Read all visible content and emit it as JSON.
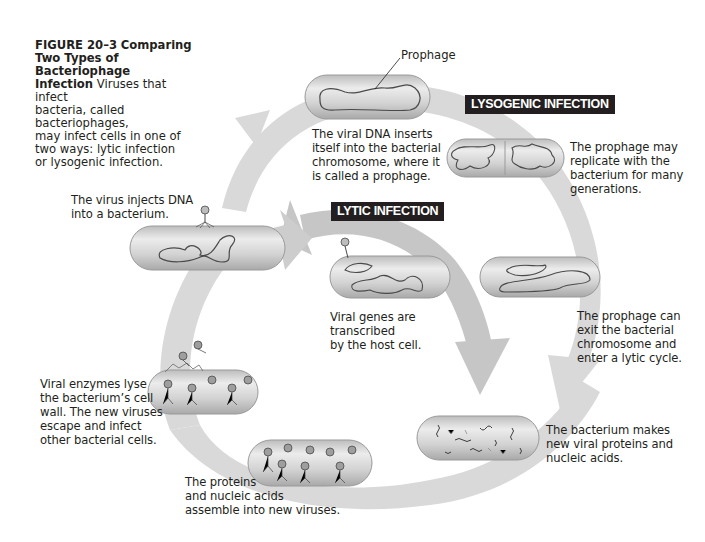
{
  "figure": {
    "number": "FIGURE 20–3",
    "title": "Comparing Two Types of Bacteriophage Infection",
    "title_line1": "Comparing",
    "title_line2": "Two Types of Bacteriophage",
    "title_line3": "Infection",
    "desc_line1": "Viruses that infect",
    "desc_line2": "bacteria, called bacteriophages,",
    "desc_line3": "may infect cells in one of",
    "desc_line4": "two ways: lytic infection",
    "desc_line5": "or lysogenic infection."
  },
  "labels": {
    "lysogenic": "LYSOGENIC INFECTION",
    "lytic": "LYTIC INFECTION",
    "prophage": "Prophage"
  },
  "steps": {
    "inject": [
      "The virus injects DNA",
      "into a bacterium."
    ],
    "insert": [
      "The viral DNA inserts",
      "itself into the bacterial",
      "chromosome, where it",
      "is called a prophage."
    ],
    "replicate": [
      "The prophage may",
      "replicate with the",
      "bacterium for many",
      "generations."
    ],
    "exit": [
      "The prophage can",
      "exit the bacterial",
      "chromosome and",
      "enter a lytic cycle."
    ],
    "transcribe": [
      "Viral genes are",
      "transcribed",
      "by the host cell."
    ],
    "make": [
      "The bacterium makes",
      "new viral proteins and",
      "nucleic acids."
    ],
    "assemble": [
      "The proteins",
      "and nucleic acids",
      "assemble into new viruses."
    ],
    "lyse": [
      "Viral enzymes lyse",
      "the bacterium’s cell",
      "wall. The new viruses",
      "escape and infect",
      "other bacterial cells."
    ]
  },
  "colors": {
    "arrow": "#d6d6d6",
    "arrow_inner": "#c4c4c4",
    "cell_fill": "#c9c9c9",
    "cell_highlight": "#efefef",
    "cell_stroke": "#9a9a9a",
    "dna": "#4a4a4a",
    "label_bg": "#231f20"
  }
}
